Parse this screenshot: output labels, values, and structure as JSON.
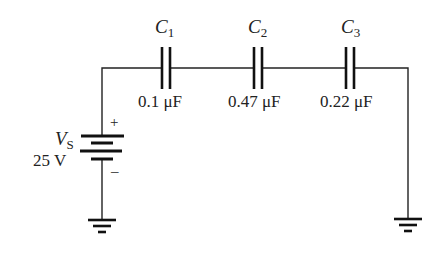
{
  "diagram": {
    "type": "series capacitor circuit",
    "source": {
      "symbol": "V",
      "subscript": "S",
      "value": "25 V",
      "plus": "+",
      "minus": "–"
    },
    "capacitors": [
      {
        "name": "C",
        "subscript": "1",
        "value": "0.1 μF"
      },
      {
        "name": "C",
        "subscript": "2",
        "value": "0.47 μF"
      },
      {
        "name": "C",
        "subscript": "3",
        "value": "0.22 μF"
      }
    ],
    "grounds": [
      "ground-left",
      "ground-right"
    ],
    "colors": {
      "line": "#111111",
      "text": "#222222",
      "background": "#ffffff"
    }
  }
}
